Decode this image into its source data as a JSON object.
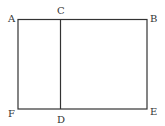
{
  "diagram": {
    "type": "rectangle-divided",
    "stroke_color": "#333333",
    "labels": {
      "A": "A",
      "B": "B",
      "C": "C",
      "D": "D",
      "E": "E",
      "F": "F"
    },
    "segments": [
      "AB",
      "BE",
      "EF",
      "FA",
      "CD"
    ]
  }
}
